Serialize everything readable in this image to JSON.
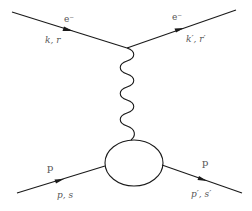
{
  "diagram": {
    "type": "feynman",
    "title": "",
    "colors": {
      "line": "#1a1a1a",
      "label": "#555555",
      "background": "#ffffff"
    },
    "particles": {
      "incoming_electron": {
        "name": "e⁻",
        "momentum_spin": "k, r"
      },
      "outgoing_electron": {
        "name": "e⁻",
        "momentum_spin": "k′, r′"
      },
      "incoming_proton": {
        "name": "p",
        "momentum_spin": "p, s"
      },
      "outgoing_proton": {
        "name": "p",
        "momentum_spin": "p′, s′"
      },
      "exchange": {
        "name": "virtual photon",
        "style": "wavy"
      },
      "hadronic_vertex": {
        "name": "proton blob",
        "style": "ellipse"
      }
    }
  }
}
